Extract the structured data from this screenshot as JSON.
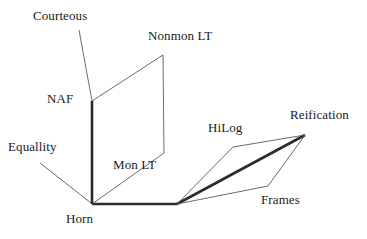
{
  "diagram": {
    "background_color": "#ffffff",
    "thick_edge_color": "#2b2b2b",
    "thin_edge_color": "#5a5a5a",
    "text_color": "#1a1a1a",
    "nodes": [
      {
        "id": "courteous",
        "label": "Courteous",
        "x": 33,
        "y": 9
      },
      {
        "id": "nonmon-lt",
        "label": "Nonmon LT",
        "x": 148,
        "y": 29
      },
      {
        "id": "naf",
        "label": "NAF",
        "x": 47,
        "y": 92
      },
      {
        "id": "reification",
        "label": "Reification",
        "x": 290,
        "y": 108
      },
      {
        "id": "hilog",
        "label": "HiLog",
        "x": 208,
        "y": 121
      },
      {
        "id": "equallity",
        "label": "Equallity",
        "x": 8,
        "y": 140
      },
      {
        "id": "mon-lt",
        "label": "Mon LT",
        "x": 113,
        "y": 158
      },
      {
        "id": "frames",
        "label": "Frames",
        "x": 261,
        "y": 193
      },
      {
        "id": "horn",
        "label": "Horn",
        "x": 66,
        "y": 212
      }
    ],
    "edges": [
      {
        "id": "courteous-leader",
        "kind": "thin",
        "points": "79,30 92,101"
      },
      {
        "id": "equallity-leader",
        "kind": "thin",
        "points": "40,163 91,203"
      },
      {
        "id": "spine-vertical",
        "kind": "thick",
        "points": "92,101 92,204"
      },
      {
        "id": "base-horizontal",
        "kind": "thick",
        "points": "92,204 177,204"
      },
      {
        "id": "reification-rise",
        "kind": "thick",
        "points": "177,204 305,135"
      },
      {
        "id": "naf-to-nonmon",
        "kind": "thin",
        "points": "92,101 163,55"
      },
      {
        "id": "nonmon-drop",
        "kind": "thin",
        "points": "163,55 164,153"
      },
      {
        "id": "mon-lt-diagonal",
        "kind": "thin",
        "points": "164,153 92,204"
      },
      {
        "id": "hilog-left-rise",
        "kind": "thin",
        "points": "177,204 233,147"
      },
      {
        "id": "hilog-top",
        "kind": "thin",
        "points": "233,147 305,135"
      },
      {
        "id": "frames-drop",
        "kind": "thin",
        "points": "305,135 268,186"
      },
      {
        "id": "frames-base",
        "kind": "thin",
        "points": "268,186 177,204"
      }
    ]
  }
}
